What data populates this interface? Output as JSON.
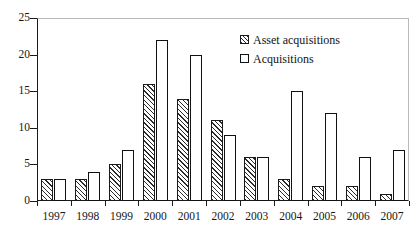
{
  "chart_data": {
    "type": "bar",
    "title": "",
    "subtitle": "",
    "xlabel": "",
    "ylabel": "",
    "categories": [
      "1997",
      "1998",
      "1999",
      "2000",
      "2001",
      "2002",
      "2003",
      "2004",
      "2005",
      "2006",
      "2007"
    ],
    "series": [
      {
        "name": "Asset acquisitions",
        "values": [
          3,
          3,
          5,
          16,
          14,
          11,
          6,
          3,
          2,
          2,
          1
        ],
        "fill": "hatch-diagonal",
        "color": "#2b2b2b"
      },
      {
        "name": "Acquisitions",
        "values": [
          3,
          4,
          7,
          22,
          20,
          9,
          6,
          15,
          12,
          6,
          7
        ],
        "fill": "white-outline",
        "color": "#111111"
      }
    ],
    "ylim": [
      0,
      25
    ],
    "yticks": [
      0,
      5,
      10,
      15,
      20,
      25
    ],
    "ytick_labels": [
      "0",
      "5",
      "10",
      "15",
      "20",
      "25"
    ],
    "grid": false,
    "legend_position": "top-right-inside",
    "axis_color": "#1a1a1a",
    "frame_color": "#b9b9b9",
    "background": "#ffffff"
  },
  "legend": {
    "items": [
      {
        "label": "Asset acquisitions",
        "swatch": "hatched-square-icon"
      },
      {
        "label": "Acquisitions",
        "swatch": "outline-square-icon"
      }
    ]
  }
}
